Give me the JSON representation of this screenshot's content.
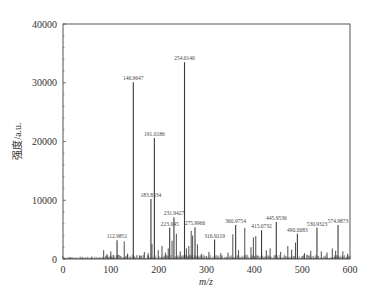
{
  "chart_data": {
    "type": "bar",
    "title": "",
    "xlabel": "m/z",
    "ylabel": "强度/a.u.",
    "xlim": [
      0,
      600
    ],
    "ylim": [
      0,
      40000
    ],
    "x_ticks": [
      0,
      100,
      200,
      300,
      400,
      500,
      600
    ],
    "y_ticks": [
      0,
      10000,
      20000,
      30000,
      40000
    ],
    "grid": false,
    "legend": null,
    "labeled_peaks": [
      {
        "mz": 112.9851,
        "label": "112.9851",
        "intensity": 3200
      },
      {
        "mz": 146.9647,
        "label": "146.9647",
        "intensity": 30100
      },
      {
        "mz": 183.8334,
        "label": "183.8334",
        "intensity": 10200
      },
      {
        "mz": 191.0186,
        "label": "191.0186",
        "intensity": 20600
      },
      {
        "mz": 223.045,
        "label": "223.045",
        "intensity": 5300
      },
      {
        "mz": 231.9427,
        "label": "231.9427",
        "intensity": 7100
      },
      {
        "mz": 254.014,
        "label": "254.0140",
        "intensity": 33500
      },
      {
        "mz": 275.9966,
        "label": "275.9966",
        "intensity": 5400
      },
      {
        "mz": 316.9219,
        "label": "316.9219",
        "intensity": 3300
      },
      {
        "mz": 360.9754,
        "label": "360.9754",
        "intensity": 5800
      },
      {
        "mz": 415.0732,
        "label": "415.0732",
        "intensity": 4900
      },
      {
        "mz": 445.9536,
        "label": "445.9536",
        "intensity": 6300
      },
      {
        "mz": 490.0083,
        "label": "490.0083",
        "intensity": 4300
      },
      {
        "mz": 530.9323,
        "label": "530.9323",
        "intensity": 5300
      },
      {
        "mz": 574.9873,
        "label": "574.9873",
        "intensity": 5800
      }
    ],
    "minor_peaks": [
      {
        "mz": 15,
        "intensity": 300
      },
      {
        "mz": 40,
        "intensity": 250
      },
      {
        "mz": 60,
        "intensity": 400
      },
      {
        "mz": 85,
        "intensity": 1500
      },
      {
        "mz": 92,
        "intensity": 800
      },
      {
        "mz": 100,
        "intensity": 1300
      },
      {
        "mz": 105,
        "intensity": 700
      },
      {
        "mz": 128,
        "intensity": 3000
      },
      {
        "mz": 135,
        "intensity": 900
      },
      {
        "mz": 160,
        "intensity": 600
      },
      {
        "mz": 170,
        "intensity": 1200
      },
      {
        "mz": 178,
        "intensity": 1000
      },
      {
        "mz": 186,
        "intensity": 2600
      },
      {
        "mz": 199,
        "intensity": 1500
      },
      {
        "mz": 207,
        "intensity": 2200
      },
      {
        "mz": 214,
        "intensity": 1100
      },
      {
        "mz": 220,
        "intensity": 1800
      },
      {
        "mz": 228,
        "intensity": 3100
      },
      {
        "mz": 237,
        "intensity": 4300
      },
      {
        "mz": 245,
        "intensity": 1300
      },
      {
        "mz": 258,
        "intensity": 1800
      },
      {
        "mz": 263,
        "intensity": 2200
      },
      {
        "mz": 268,
        "intensity": 4800
      },
      {
        "mz": 271,
        "intensity": 4000
      },
      {
        "mz": 281,
        "intensity": 2500
      },
      {
        "mz": 290,
        "intensity": 900
      },
      {
        "mz": 305,
        "intensity": 1200
      },
      {
        "mz": 330,
        "intensity": 1000
      },
      {
        "mz": 345,
        "intensity": 1100
      },
      {
        "mz": 355,
        "intensity": 4200
      },
      {
        "mz": 367,
        "intensity": 1500
      },
      {
        "mz": 380,
        "intensity": 5300
      },
      {
        "mz": 393,
        "intensity": 2000
      },
      {
        "mz": 398,
        "intensity": 3700
      },
      {
        "mz": 403,
        "intensity": 3900
      },
      {
        "mz": 425,
        "intensity": 1500
      },
      {
        "mz": 433,
        "intensity": 1800
      },
      {
        "mz": 455,
        "intensity": 1200
      },
      {
        "mz": 470,
        "intensity": 2200
      },
      {
        "mz": 478,
        "intensity": 1600
      },
      {
        "mz": 486,
        "intensity": 2800
      },
      {
        "mz": 505,
        "intensity": 1000
      },
      {
        "mz": 518,
        "intensity": 1400
      },
      {
        "mz": 540,
        "intensity": 1300
      },
      {
        "mz": 552,
        "intensity": 1100
      },
      {
        "mz": 563,
        "intensity": 1800
      },
      {
        "mz": 570,
        "intensity": 1400
      },
      {
        "mz": 585,
        "intensity": 1300
      },
      {
        "mz": 595,
        "intensity": 900
      }
    ]
  },
  "style": {
    "peak_color": "#3a3a3a",
    "axis_color": "#555555",
    "text_color": "#333333"
  }
}
